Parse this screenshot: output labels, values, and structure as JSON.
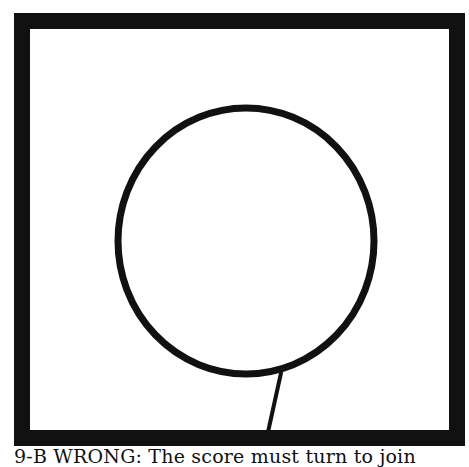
{
  "figure": {
    "frame": {
      "x": 14,
      "y": 13,
      "width": 451,
      "height": 433,
      "stroke_width": 16,
      "color": "#111111"
    },
    "circle": {
      "cx": 246,
      "cy": 241,
      "rx": 131,
      "ry": 136,
      "stroke_width": 7,
      "color": "#111111"
    },
    "stem": {
      "x1": 281,
      "y1": 372,
      "x2": 268,
      "y2": 432,
      "stroke_width": 4,
      "color": "#111111"
    }
  },
  "caption": {
    "text": "9-B WRONG: The score must turn to join"
  }
}
